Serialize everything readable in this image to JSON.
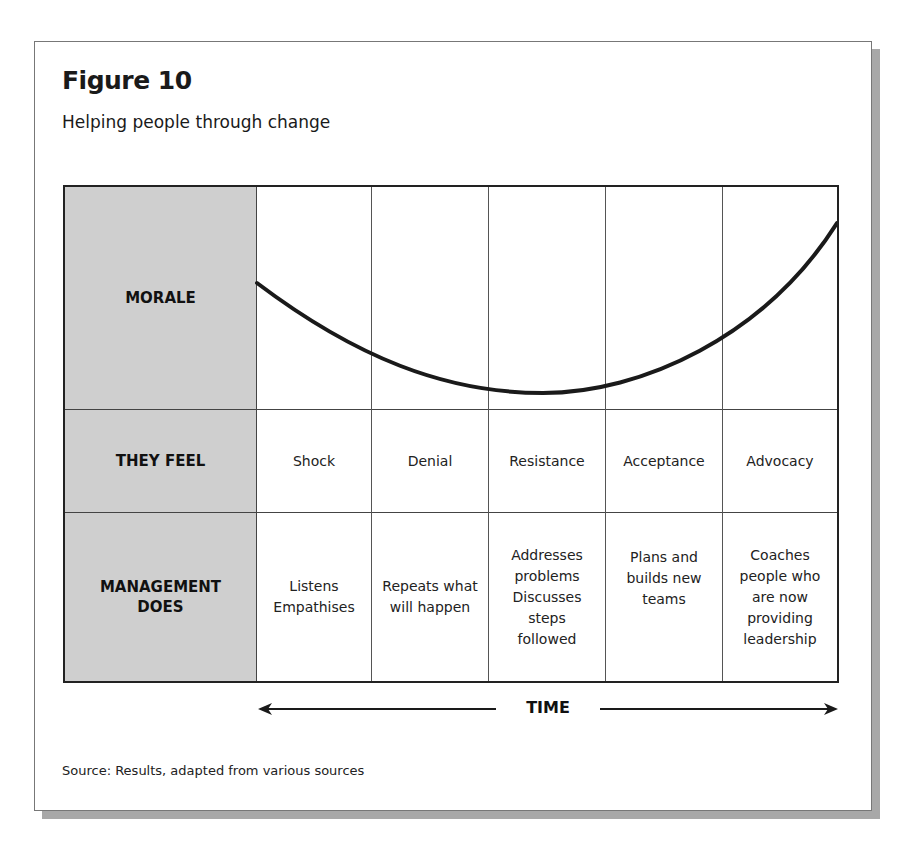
{
  "figure": {
    "title": "Figure 10",
    "subtitle": "Helping people through change",
    "source": "Source: Results, adapted from various sources"
  },
  "rows": {
    "morale": "MORALE",
    "they_feel": "THEY FEEL",
    "management_line1": "MANAGEMENT",
    "management_line2": "DOES"
  },
  "stages": [
    {
      "feel": "Shock",
      "does": [
        "Listens",
        "Empathises"
      ]
    },
    {
      "feel": "Denial",
      "does": [
        "Repeats what",
        "will happen"
      ]
    },
    {
      "feel": "Resistance",
      "does": [
        "Addresses",
        "problems",
        "Discusses",
        "steps",
        "followed"
      ]
    },
    {
      "feel": "Acceptance",
      "does": [
        "Plans and",
        "builds new",
        "teams"
      ]
    },
    {
      "feel": "Advocacy",
      "does": [
        "Coaches",
        "people who",
        "are now",
        "providing",
        "leadership"
      ]
    }
  ],
  "axis": {
    "time_label": "TIME"
  },
  "colors": {
    "label_column_bg": "#cfcfcf",
    "line": "#1a1a1a",
    "shadow": "#a8a8a8"
  }
}
